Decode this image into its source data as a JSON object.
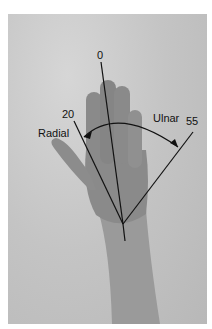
{
  "figure": {
    "labels": {
      "zero": "0",
      "radial_angle": "20",
      "ulnar_angle": "55",
      "radial": "Radial",
      "ulnar": "Ulnar"
    },
    "colors": {
      "background": "#c4c4c4",
      "hand": "#8e8e8e",
      "lines": "#111111"
    }
  }
}
